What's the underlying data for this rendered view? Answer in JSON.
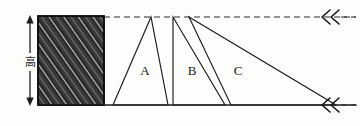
{
  "figure": {
    "background_color": "#fdfdfc",
    "ink_color": "#1c1c1c"
  },
  "dimension": {
    "label": "高",
    "meaning": "height",
    "arrow_style": "double-headed-vertical"
  },
  "shapes": {
    "rectangle": {
      "name": "hatched-rectangle",
      "fill_style": "diagonal-hatching",
      "hatch_direction": "lower-left-to-upper-right",
      "x": 38,
      "y": 16,
      "width": 66,
      "height": 89
    },
    "triangles": [
      {
        "label": "A",
        "apex": [
          151,
          17
        ],
        "base_left": [
          113,
          105
        ],
        "base_right": [
          168,
          105
        ],
        "label_pos": [
          145,
          75
        ]
      },
      {
        "label": "B",
        "apex": [
          173,
          17
        ],
        "base_left": [
          173,
          105
        ],
        "base_right": [
          225,
          105
        ],
        "label_pos": [
          192,
          75
        ]
      },
      {
        "label": "C",
        "apex": [
          189,
          17
        ],
        "base_left": [
          231,
          105
        ],
        "base_right": [
          336,
          105
        ],
        "label_pos": [
          238,
          75
        ]
      }
    ]
  },
  "guides": {
    "top_line": {
      "name": "upper-parallel-dashed-line",
      "style": "dashed",
      "y": 17,
      "x_start": 104,
      "x_end": 356
    },
    "bottom_line": {
      "name": "lower-baseline",
      "style": "solid",
      "y": 105,
      "x_start": 38,
      "x_end": 356
    },
    "markers": [
      {
        "name": "top-double-chevron",
        "glyph": "≪",
        "x": 324,
        "y": 17
      },
      {
        "name": "bottom-double-chevron",
        "glyph": "≪",
        "x": 324,
        "y": 105
      }
    ]
  }
}
